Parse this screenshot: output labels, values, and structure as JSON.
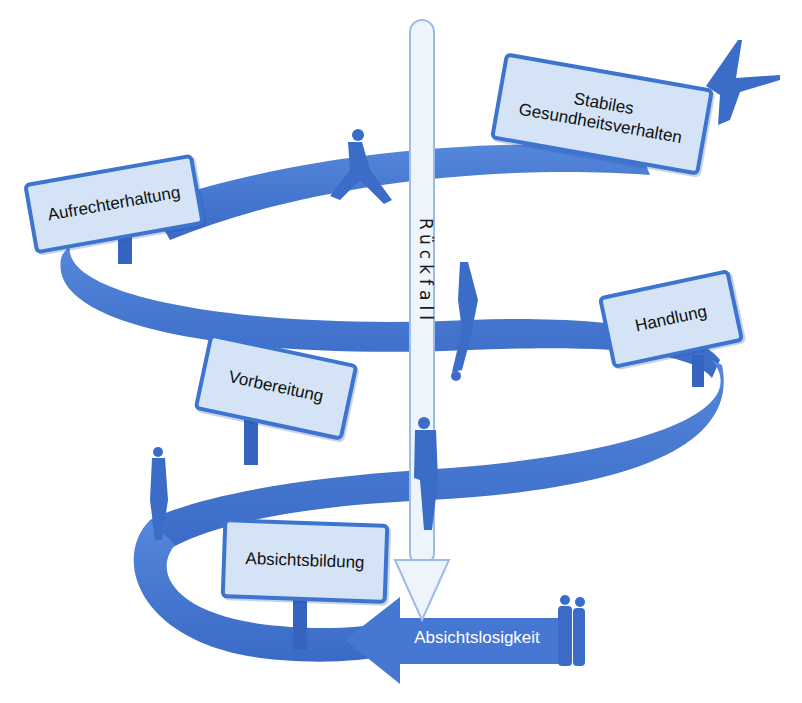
{
  "diagram": {
    "type": "spiral stage model",
    "colors": {
      "ribbon": "#4478d2",
      "ribbon_dark": "#3563c0",
      "sign_fill": "#d4e4f6",
      "sign_border": "#3d74cf",
      "relapse_arrow_fill": "#eef4fc",
      "relapse_arrow_stroke": "#9cbbe6",
      "silhouette": "#3a6cc8"
    },
    "stages": [
      {
        "label": "Absichtslosigkeit",
        "position": "bottom arrow (start)"
      },
      {
        "label": "Absichtsbildung",
        "position": "lower left sign"
      },
      {
        "label": "Vorbereitung",
        "position": "middle left sign"
      },
      {
        "label": "Handlung",
        "position": "middle right sign"
      },
      {
        "label": "Aufrechterhaltung",
        "position": "upper left sign"
      },
      {
        "label": "Stabiles Gesundheitsverhalten",
        "lines": [
          "Stabiles",
          "Gesundheitsverhalten"
        ],
        "position": "top right sign"
      }
    ],
    "relapse": {
      "label": "Rückfall",
      "direction": "downward"
    },
    "figures": [
      "two-people-standing",
      "woman-standing",
      "man-on-phone",
      "person-falling",
      "man-running",
      "person-jumping-arms-raised"
    ]
  }
}
